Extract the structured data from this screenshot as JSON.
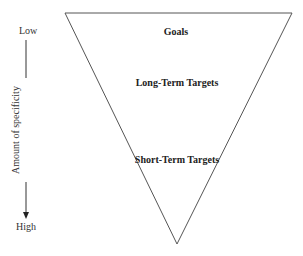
{
  "diagram": {
    "type": "inverted-pyramid",
    "axis": {
      "label": "Amount of specificity",
      "top_label": "Low",
      "bottom_label": "High",
      "direction": "down"
    },
    "tiers": [
      {
        "label": "Goals"
      },
      {
        "label": "Long-Term Targets"
      },
      {
        "label": "Short-Term Targets"
      }
    ],
    "colors": {
      "stroke": "#555555",
      "text": "#222222",
      "background": "#ffffff"
    }
  }
}
